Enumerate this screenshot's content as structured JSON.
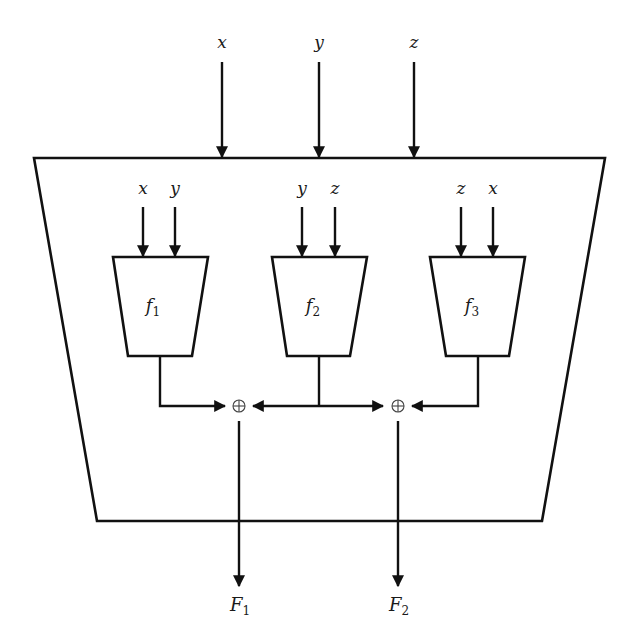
{
  "diagram": {
    "outer_block": {
      "shape": "inverted-trapezoid"
    },
    "inputs": [
      {
        "label": "x"
      },
      {
        "label": "y"
      },
      {
        "label": "z"
      }
    ],
    "functions": [
      {
        "name": "f",
        "sub": "1",
        "inputs": [
          "x",
          "y"
        ]
      },
      {
        "name": "f",
        "sub": "2",
        "inputs": [
          "y",
          "z"
        ]
      },
      {
        "name": "f",
        "sub": "3",
        "inputs": [
          "z",
          "x"
        ]
      }
    ],
    "xor_gates": [
      {
        "symbol": "⊕",
        "inputs": [
          "f1",
          "f2"
        ],
        "output": "F1"
      },
      {
        "symbol": "⊕",
        "inputs": [
          "f2",
          "f3"
        ],
        "output": "F2"
      }
    ],
    "outputs": [
      {
        "name": "F",
        "sub": "1"
      },
      {
        "name": "F",
        "sub": "2"
      }
    ],
    "colors": {
      "stroke": "#111111",
      "background": "#ffffff"
    }
  }
}
